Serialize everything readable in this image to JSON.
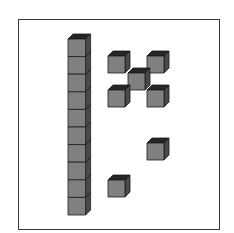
{
  "diagram": {
    "type": "base-ten-blocks",
    "colors": {
      "face": "#808080",
      "top": "#262626",
      "side": "#4a4a4a",
      "edge": "#1a1a1a",
      "frame": "#3a3a3a",
      "background": "#ffffff"
    },
    "rod": {
      "count": 10,
      "x": 68,
      "y": 39,
      "size": 17.6,
      "depth": 5
    },
    "units": [
      {
        "x": 108,
        "y": 56
      },
      {
        "x": 147,
        "y": 56
      },
      {
        "x": 128,
        "y": 73
      },
      {
        "x": 108,
        "y": 90
      },
      {
        "x": 147,
        "y": 90
      },
      {
        "x": 147,
        "y": 143
      },
      {
        "x": 108,
        "y": 180
      }
    ],
    "unit_size": 17,
    "unit_depth": 5,
    "totals": {
      "tens": 1,
      "ones": 7,
      "value": 17
    }
  }
}
